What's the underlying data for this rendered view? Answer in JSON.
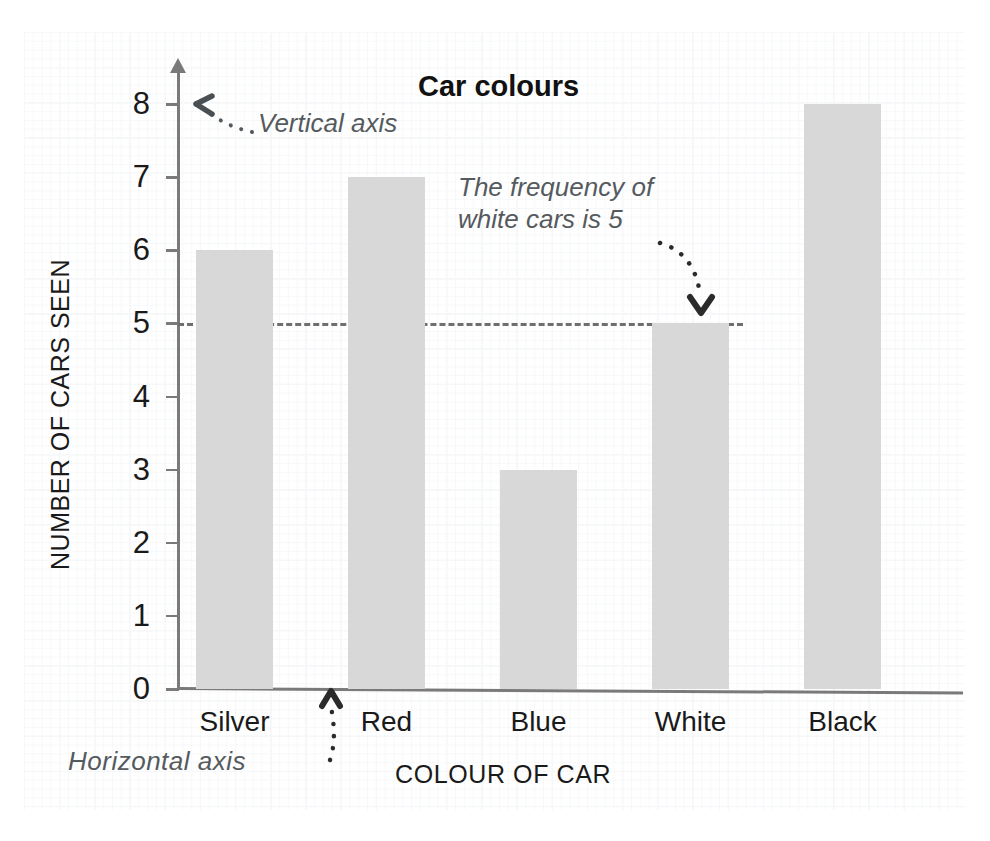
{
  "chart_data": {
    "type": "bar",
    "title": "Car colours",
    "xlabel": "COLOUR OF CAR",
    "ylabel": "NUMBER OF CARS SEEN",
    "categories": [
      "Silver",
      "Red",
      "Blue",
      "White",
      "Black"
    ],
    "values": [
      6,
      7,
      3,
      5,
      8
    ],
    "ylim": [
      0,
      8
    ],
    "yticks": [
      "0",
      "1",
      "2",
      "3",
      "4",
      "5",
      "6",
      "7",
      "8"
    ],
    "grid": true,
    "legend": "none",
    "bar_color": "#d8d8d8",
    "axis_color": "#7a7a7a",
    "annotations": [
      {
        "id": "vertical-axis",
        "text": "Vertical axis",
        "points_to": "y-axis"
      },
      {
        "id": "frequency-note",
        "text": "The frequency of white cars is 5",
        "points_to": "white-bar"
      },
      {
        "id": "horizontal-axis",
        "text": "Horizontal  axis",
        "points_to": "x-axis"
      }
    ],
    "reference_line": {
      "value": 5,
      "style": "dashed",
      "color": "#6f6f6f"
    }
  },
  "chart": {
    "title": "Car colours",
    "x_axis_title": "COLOUR OF CAR",
    "y_axis_title": "NUMBER OF CARS SEEN",
    "y_ticks": [
      "8",
      "7",
      "6",
      "5",
      "4",
      "3",
      "2",
      "1",
      "0"
    ],
    "bars": [
      {
        "label": "Silver",
        "value": 6
      },
      {
        "label": "Red",
        "value": 7
      },
      {
        "label": "Blue",
        "value": 3
      },
      {
        "label": "White",
        "value": 5
      },
      {
        "label": "Black",
        "value": 8
      }
    ]
  },
  "annotations": {
    "vertical_axis": "Vertical axis",
    "frequency_note": "The frequency of white cars is 5",
    "horizontal_axis": "Horizontal  axis"
  },
  "colors": {
    "bar": "#d8d8d8",
    "axis": "#7a7a7a",
    "grid": "#eceef0",
    "annotation_text": "#555a5e",
    "label_text": "#1a1a1a"
  }
}
